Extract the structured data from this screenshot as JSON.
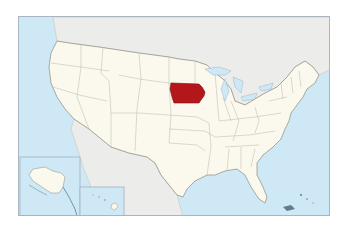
{
  "map": {
    "type": "locator-map",
    "region": "United States",
    "highlighted_state": "Iowa",
    "colors": {
      "ocean": "#cfe8f5",
      "land_us": "#fbf9ee",
      "land_foreign": "#ececea",
      "highlight": "#b3171a",
      "state_border": "#b9b6a8",
      "frame": "#a9b6c2"
    },
    "insets": [
      "Alaska",
      "Hawaii"
    ]
  }
}
